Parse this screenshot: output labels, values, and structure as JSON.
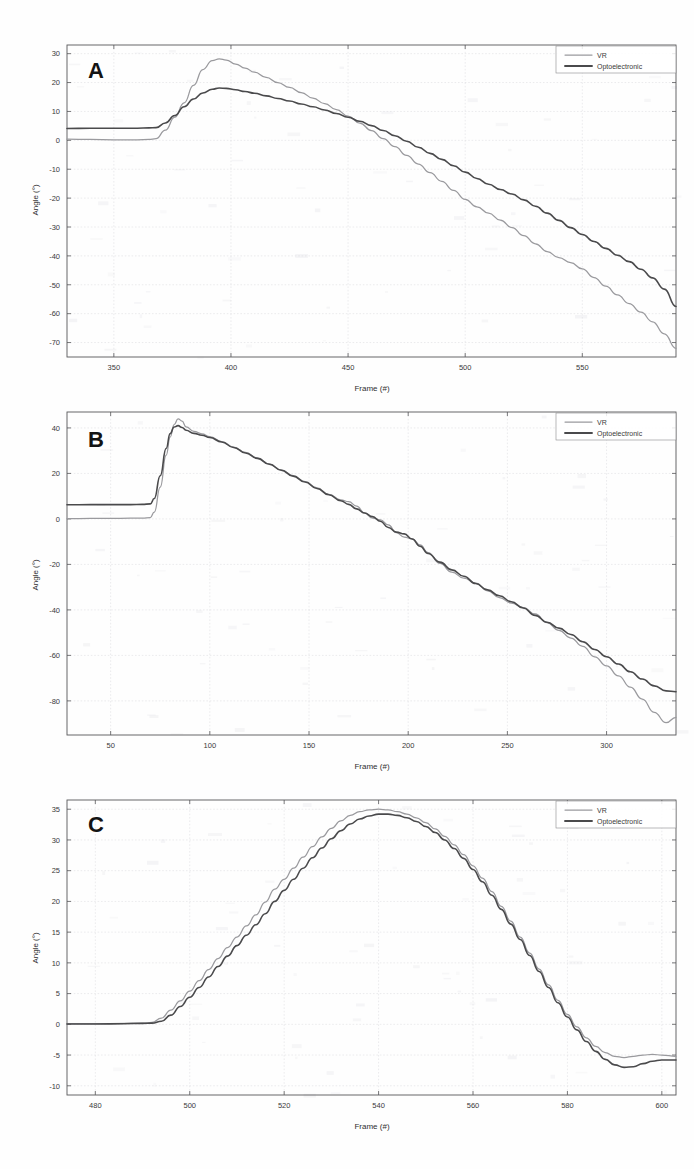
{
  "figure": {
    "background": "#fefefe",
    "series_colors": {
      "vr": "#9a9a9e",
      "opto": "#4a4a4c"
    }
  },
  "legend": {
    "vr_label": "VR",
    "opto_label": "Optoelectronic"
  },
  "panels": [
    {
      "id": "A",
      "letter": "A"
    },
    {
      "id": "B",
      "letter": "B"
    },
    {
      "id": "C",
      "letter": "C"
    }
  ],
  "chart_data": [
    {
      "type": "line",
      "panel": "A",
      "title": "A",
      "xlabel": "Frame (#)",
      "ylabel": "Angle (°)",
      "xlim": [
        330,
        590
      ],
      "ylim": [
        -75,
        33
      ],
      "xticks": [
        350,
        400,
        450,
        500,
        550
      ],
      "yticks": [
        30,
        20,
        10,
        0,
        -10,
        -20,
        -30,
        -40,
        -50,
        -60,
        -70
      ],
      "grid": true,
      "legend_position": "top-right",
      "series": [
        {
          "name": "VR",
          "color": "#9a9a9e",
          "x": [
            330,
            340,
            350,
            360,
            365,
            368,
            372,
            376,
            380,
            384,
            388,
            392,
            395,
            398,
            402,
            406,
            410,
            415,
            420,
            425,
            430,
            435,
            440,
            445,
            450,
            455,
            460,
            465,
            470,
            475,
            480,
            485,
            490,
            495,
            500,
            505,
            510,
            515,
            520,
            525,
            530,
            535,
            540,
            545,
            550,
            555,
            560,
            565,
            570,
            575,
            580,
            585,
            590
          ],
          "y": [
            0.4,
            0.3,
            0.2,
            0.2,
            0.3,
            0.6,
            3.5,
            8.0,
            13.0,
            19.0,
            24.5,
            27.6,
            28.2,
            27.8,
            26.4,
            25.0,
            23.6,
            21.8,
            20.0,
            18.3,
            16.5,
            14.6,
            12.7,
            10.6,
            8.4,
            6.0,
            3.4,
            0.6,
            -2.2,
            -5.2,
            -8.2,
            -11.2,
            -14.2,
            -17.3,
            -20.4,
            -23.0,
            -25.2,
            -27.6,
            -30.2,
            -33.0,
            -35.8,
            -38.5,
            -40.6,
            -42.3,
            -44.5,
            -47.5,
            -50.5,
            -53.5,
            -56.5,
            -59.5,
            -62.8,
            -67.0,
            -72.0
          ]
        },
        {
          "name": "Optoelectronic",
          "color": "#4a4a4c",
          "x": [
            330,
            340,
            350,
            360,
            365,
            368,
            372,
            376,
            380,
            384,
            388,
            392,
            395,
            398,
            402,
            406,
            410,
            415,
            420,
            425,
            430,
            435,
            440,
            445,
            450,
            455,
            460,
            465,
            470,
            475,
            480,
            485,
            490,
            495,
            500,
            505,
            510,
            515,
            520,
            525,
            530,
            535,
            540,
            545,
            550,
            555,
            560,
            565,
            570,
            575,
            580,
            585,
            590
          ],
          "y": [
            4.1,
            4.2,
            4.2,
            4.2,
            4.3,
            4.4,
            6.0,
            8.6,
            11.6,
            14.3,
            16.4,
            17.7,
            18.1,
            18.0,
            17.5,
            16.9,
            16.3,
            15.4,
            14.5,
            13.6,
            12.6,
            11.6,
            10.5,
            9.3,
            8.0,
            6.6,
            5.1,
            3.4,
            1.6,
            -0.3,
            -2.4,
            -4.5,
            -6.6,
            -8.8,
            -11.0,
            -13.2,
            -15.2,
            -17.0,
            -18.6,
            -20.6,
            -22.8,
            -25.2,
            -27.7,
            -30.2,
            -32.6,
            -35.0,
            -37.4,
            -39.8,
            -42.0,
            -44.6,
            -47.6,
            -51.5,
            -57.5
          ]
        }
      ]
    },
    {
      "type": "line",
      "panel": "B",
      "title": "B",
      "xlabel": "Frame (#)",
      "ylabel": "Angle (°)",
      "xlim": [
        28,
        335
      ],
      "ylim": [
        -95,
        47
      ],
      "xticks": [
        50,
        100,
        150,
        200,
        250,
        300
      ],
      "yticks": [
        40,
        20,
        0,
        -20,
        -40,
        -60,
        -80
      ],
      "grid": true,
      "legend_position": "top-right",
      "series": [
        {
          "name": "VR",
          "color": "#9a9a9e",
          "x": [
            28,
            40,
            50,
            60,
            66,
            70,
            72,
            75,
            78,
            80,
            82,
            84,
            86,
            88,
            92,
            96,
            100,
            106,
            112,
            118,
            124,
            130,
            136,
            142,
            148,
            154,
            160,
            166,
            170,
            174,
            178,
            182,
            186,
            190,
            194,
            198,
            202,
            206,
            210,
            216,
            222,
            228,
            234,
            240,
            246,
            252,
            258,
            264,
            270,
            276,
            282,
            288,
            294,
            300,
            306,
            312,
            318,
            324,
            330,
            335
          ],
          "y": [
            0.1,
            0.2,
            0.2,
            0.3,
            0.4,
            0.6,
            3.0,
            14.0,
            28.0,
            36.0,
            41.5,
            44.0,
            43.0,
            40.5,
            38.5,
            37.4,
            36.2,
            34.0,
            31.6,
            29.2,
            26.8,
            24.2,
            21.6,
            19.0,
            16.4,
            13.6,
            10.8,
            8.4,
            7.6,
            5.6,
            2.6,
            0.4,
            -0.4,
            -2.6,
            -6.0,
            -8.0,
            -8.8,
            -11.4,
            -14.8,
            -19.6,
            -23.4,
            -26.0,
            -28.2,
            -31.6,
            -34.6,
            -37.0,
            -39.0,
            -41.8,
            -45.6,
            -49.0,
            -52.4,
            -56.0,
            -60.6,
            -64.6,
            -69.0,
            -74.0,
            -79.2,
            -85.0,
            -89.6,
            -87.2
          ]
        },
        {
          "name": "Optoelectronic",
          "color": "#4a4a4c",
          "x": [
            28,
            40,
            50,
            60,
            66,
            70,
            72,
            75,
            78,
            80,
            82,
            84,
            86,
            88,
            92,
            96,
            100,
            106,
            112,
            118,
            124,
            130,
            136,
            142,
            148,
            154,
            160,
            166,
            170,
            174,
            178,
            182,
            186,
            190,
            194,
            198,
            202,
            206,
            210,
            216,
            222,
            228,
            234,
            240,
            246,
            252,
            258,
            264,
            270,
            276,
            282,
            288,
            294,
            300,
            306,
            312,
            318,
            324,
            330,
            335
          ],
          "y": [
            6.2,
            6.3,
            6.3,
            6.3,
            6.4,
            6.6,
            9.0,
            19.0,
            31.0,
            37.5,
            40.4,
            41.0,
            40.2,
            39.0,
            37.6,
            36.8,
            35.8,
            33.8,
            31.4,
            29.0,
            26.6,
            24.0,
            21.4,
            18.8,
            16.2,
            13.4,
            10.6,
            8.0,
            6.4,
            4.4,
            2.6,
            1.0,
            -1.0,
            -3.8,
            -5.8,
            -6.6,
            -8.8,
            -12.0,
            -15.2,
            -19.0,
            -22.4,
            -25.2,
            -28.4,
            -31.2,
            -33.8,
            -36.4,
            -39.2,
            -42.4,
            -45.4,
            -48.0,
            -50.8,
            -54.0,
            -57.4,
            -60.6,
            -63.8,
            -67.2,
            -70.4,
            -73.4,
            -75.6,
            -76.0
          ]
        }
      ]
    },
    {
      "type": "line",
      "panel": "C",
      "title": "C",
      "xlabel": "Frame (#)",
      "ylabel": "Angle (°)",
      "xlim": [
        474,
        603
      ],
      "ylim": [
        -11.5,
        36.5
      ],
      "xticks": [
        480,
        500,
        520,
        540,
        560,
        580,
        600
      ],
      "yticks": [
        35,
        30,
        25,
        20,
        15,
        10,
        5,
        0,
        -5,
        -10
      ],
      "grid": true,
      "legend_position": "top-right",
      "series": [
        {
          "name": "VR",
          "color": "#9a9a9e",
          "x": [
            474,
            480,
            486,
            490,
            492,
            494,
            496,
            498,
            500,
            502,
            504,
            506,
            508,
            510,
            512,
            514,
            516,
            518,
            520,
            522,
            524,
            526,
            528,
            530,
            532,
            534,
            536,
            538,
            540,
            542,
            544,
            546,
            548,
            550,
            552,
            554,
            556,
            558,
            560,
            562,
            564,
            566,
            568,
            570,
            572,
            574,
            576,
            578,
            580,
            582,
            584,
            586,
            588,
            590,
            592,
            594,
            596,
            598,
            600,
            603
          ],
          "y": [
            0.1,
            0.1,
            0.15,
            0.2,
            0.3,
            1.0,
            2.3,
            3.8,
            5.4,
            7.1,
            8.9,
            10.7,
            12.5,
            14.2,
            16.0,
            17.8,
            19.9,
            22.0,
            23.6,
            25.4,
            27.2,
            28.9,
            30.5,
            31.9,
            33.1,
            34.0,
            34.6,
            34.9,
            35.0,
            34.9,
            34.6,
            34.2,
            33.6,
            32.8,
            31.8,
            30.6,
            29.2,
            27.6,
            25.8,
            23.8,
            21.6,
            19.2,
            16.8,
            14.2,
            11.6,
            9.0,
            6.4,
            3.9,
            1.6,
            -0.4,
            -2.2,
            -3.6,
            -4.6,
            -5.2,
            -5.4,
            -5.2,
            -5.0,
            -4.9,
            -5.0,
            -5.2
          ]
        },
        {
          "name": "Optoelectronic",
          "color": "#4a4a4c",
          "x": [
            474,
            480,
            486,
            490,
            492,
            494,
            496,
            498,
            500,
            502,
            504,
            506,
            508,
            510,
            512,
            514,
            516,
            518,
            520,
            522,
            524,
            526,
            528,
            530,
            532,
            534,
            536,
            538,
            540,
            542,
            544,
            546,
            548,
            550,
            552,
            554,
            556,
            558,
            560,
            562,
            564,
            566,
            568,
            570,
            572,
            574,
            576,
            578,
            580,
            582,
            584,
            586,
            588,
            590,
            592,
            594,
            596,
            598,
            600,
            603
          ],
          "y": [
            0.05,
            0.05,
            0.1,
            0.15,
            0.2,
            0.5,
            1.5,
            2.9,
            4.4,
            6.0,
            7.7,
            9.4,
            11.1,
            12.8,
            14.5,
            16.2,
            18.0,
            20.0,
            21.8,
            23.6,
            25.4,
            27.1,
            28.7,
            30.2,
            31.5,
            32.6,
            33.4,
            33.9,
            34.2,
            34.2,
            34.0,
            33.6,
            33.0,
            32.2,
            31.2,
            30.0,
            28.6,
            27.0,
            25.2,
            23.2,
            21.0,
            18.7,
            16.3,
            13.8,
            11.2,
            8.6,
            6.0,
            3.5,
            1.2,
            -0.9,
            -2.8,
            -4.4,
            -5.7,
            -6.6,
            -7.0,
            -6.9,
            -6.4,
            -6.0,
            -5.8,
            -5.8
          ]
        }
      ]
    }
  ]
}
